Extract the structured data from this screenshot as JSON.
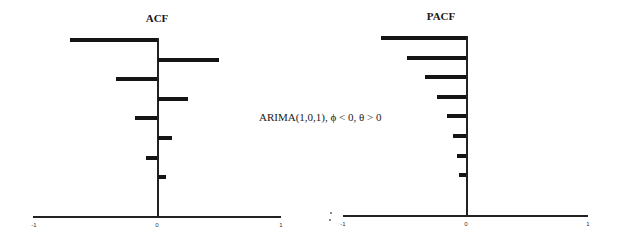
{
  "annotation": "ARIMA(1,0,1), ϕ < 0, θ > 0",
  "chart_data": [
    {
      "type": "bar",
      "orientation": "horizontal",
      "title": "ACF",
      "categories": [
        1,
        2,
        3,
        4,
        5,
        6,
        7,
        8
      ],
      "values": [
        -0.71,
        0.5,
        -0.34,
        0.25,
        -0.18,
        0.12,
        -0.09,
        0.07
      ],
      "xlabel": "",
      "ylabel": "",
      "xlim": [
        -1,
        1
      ],
      "xticks": [
        "-1",
        "0",
        "1"
      ],
      "grid": false
    },
    {
      "type": "bar",
      "orientation": "horizontal",
      "title": "PACF",
      "categories": [
        1,
        2,
        3,
        4,
        5,
        6,
        7,
        8
      ],
      "values": [
        -0.7,
        -0.49,
        -0.34,
        -0.24,
        -0.16,
        -0.11,
        -0.08,
        -0.06
      ],
      "xlabel": "",
      "ylabel": "",
      "xlim": [
        -1,
        1
      ],
      "xticks": [
        "-1",
        "0",
        "1"
      ],
      "grid": false
    }
  ]
}
